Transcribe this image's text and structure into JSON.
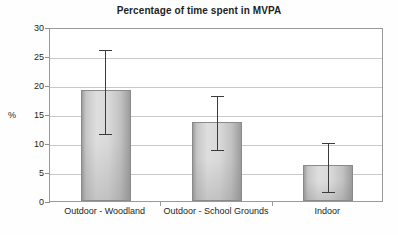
{
  "chart_data": {
    "type": "bar",
    "title": "Percentage of time spent in MVPA",
    "xlabel": "",
    "ylabel": "%",
    "categories": [
      "Outdoor - Woodland",
      "Outdoor - School Grounds",
      "Indoor"
    ],
    "values": [
      19.1,
      13.6,
      6.2
    ],
    "error_upper": [
      26.3,
      18.4,
      10.4
    ],
    "error_lower": [
      11.8,
      8.9,
      1.8
    ],
    "series": [
      {
        "name": "Percentage of time spent in MVPA",
        "values": [
          19.1,
          13.6,
          6.2
        ]
      }
    ],
    "ylim": [
      0,
      30
    ],
    "ytick_labels": [
      "0",
      "5",
      "10",
      "15",
      "20",
      "25",
      "30"
    ],
    "ytick_values": [
      0,
      5,
      10,
      15,
      20,
      25,
      30
    ],
    "grid": true,
    "grid_axis": "y",
    "legend": false,
    "legend_position": "none",
    "error_bars": true,
    "bar_fill_color": "#d6d6d6",
    "bar_edge_color": "#8a8a8a",
    "error_bar_color": "#3b3b3b",
    "grid_color": "#c9c9c9",
    "axis_color": "#9a9a9a",
    "text_color": "#231f20",
    "background_color": "#ffffff"
  },
  "axes": {
    "y_title": "%",
    "ticks": [
      {
        "label": "30",
        "value": 30
      },
      {
        "label": "25",
        "value": 25
      },
      {
        "label": "20",
        "value": 20
      },
      {
        "label": "15",
        "value": 15
      },
      {
        "label": "10",
        "value": 10
      },
      {
        "label": "5",
        "value": 5
      },
      {
        "label": "0",
        "value": 0
      }
    ]
  }
}
